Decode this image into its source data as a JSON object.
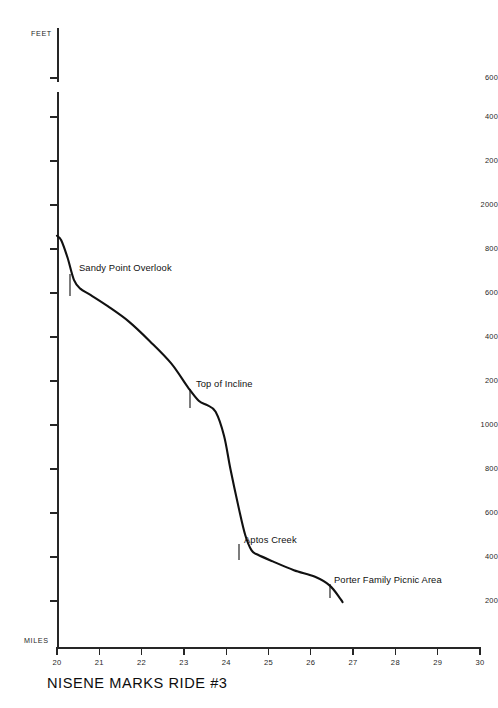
{
  "chart_data": {
    "type": "line",
    "title": "NISENE MARKS RIDE #3",
    "xlabel": "MILES",
    "ylabel": "FEET",
    "xlim": [
      20,
      30
    ],
    "ylim": [
      0,
      2600
    ],
    "grid": false,
    "legend": null,
    "axis_break": {
      "present": true,
      "between": [
        2600,
        2400
      ],
      "note": "vertical axis is broken between the 2600 tick and the 2400 tick"
    },
    "xticks": [
      20,
      21,
      22,
      23,
      24,
      25,
      26,
      27,
      28,
      29,
      30
    ],
    "xtick_labels": [
      "20",
      "21",
      "22",
      "23",
      "24",
      "25",
      "26",
      "27",
      "28",
      "29",
      "30"
    ],
    "yticks": [
      2600,
      2400,
      2200,
      2000,
      1800,
      1600,
      1400,
      1200,
      1000,
      800,
      600,
      400,
      200
    ],
    "ytick_labels": [
      "600",
      "400",
      "200",
      "2000",
      "800",
      "600",
      "400",
      "200",
      "1000",
      "800",
      "600",
      "400",
      "200"
    ],
    "series": [
      {
        "name": "Elevation profile",
        "x": [
          20.0,
          20.1,
          20.25,
          20.4,
          20.55,
          20.8,
          21.2,
          21.7,
          22.2,
          22.7,
          23.1,
          23.35,
          23.55,
          23.75,
          23.95,
          24.1,
          24.3,
          24.45,
          24.6,
          24.75,
          25.1,
          25.6,
          26.1,
          26.45,
          26.7,
          26.75
        ],
        "y": [
          1860,
          1840,
          1760,
          1660,
          1620,
          1590,
          1540,
          1470,
          1380,
          1280,
          1170,
          1110,
          1090,
          1060,
          950,
          800,
          620,
          500,
          430,
          410,
          380,
          340,
          310,
          270,
          210,
          195
        ]
      }
    ],
    "annotations": [
      {
        "label": "Sandy Point Overlook",
        "x": 20.45,
        "y": 1620,
        "text_left": 79,
        "text_top": 263,
        "leader": {
          "x1": 70,
          "y1": 274,
          "x2": 70,
          "y2": 296
        }
      },
      {
        "label": "Top of Incline",
        "x": 23.5,
        "y": 1095,
        "text_left": 196,
        "text_top": 379,
        "leader": {
          "x1": 190,
          "y1": 389,
          "x2": 190,
          "y2": 408
        }
      },
      {
        "label": "Aptos Creek",
        "x": 24.55,
        "y": 430,
        "text_left": 244,
        "text_top": 535,
        "leader": {
          "x1": 239,
          "y1": 544,
          "x2": 239,
          "y2": 560
        }
      },
      {
        "label": "Porter Family Picnic Area",
        "x": 26.62,
        "y": 220,
        "text_left": 334,
        "text_top": 575,
        "leader": {
          "x1": 330,
          "y1": 584,
          "x2": 330,
          "y2": 598
        }
      }
    ]
  },
  "axis": {
    "feet_caption": "FEET",
    "miles_caption": "MILES"
  },
  "title": {
    "text": "NISENE MARKS RIDE #3"
  }
}
